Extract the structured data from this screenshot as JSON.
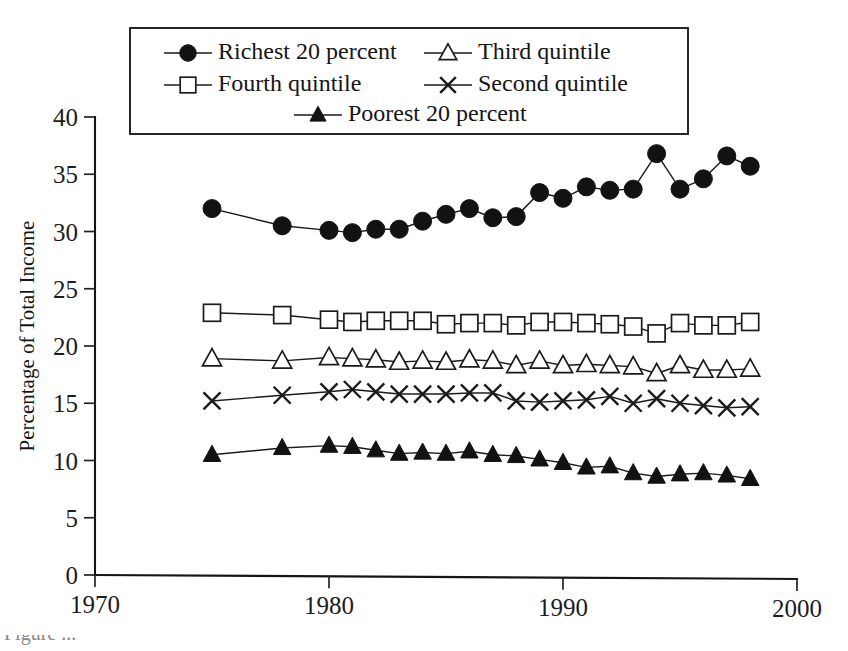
{
  "chart_data": {
    "type": "line",
    "title": "",
    "subtitle": "",
    "xlabel": "",
    "ylabel": "Percentage of Total Income",
    "xlim": [
      1970,
      2000
    ],
    "ylim": [
      0,
      40
    ],
    "xticks": [
      1970,
      1980,
      1990,
      2000
    ],
    "xtick_labels": [
      "1970",
      "1980",
      "1990",
      "2000"
    ],
    "yticks": [
      0,
      5,
      10,
      15,
      20,
      25,
      30,
      35,
      40
    ],
    "ytick_labels": [
      "0",
      "5",
      "10",
      "15",
      "20",
      "25",
      "30",
      "35",
      "40"
    ],
    "grid": false,
    "legend_position": "top-inside",
    "x": [
      1975,
      1978,
      1980,
      1981,
      1982,
      1983,
      1984,
      1985,
      1986,
      1987,
      1988,
      1989,
      1990,
      1991,
      1992,
      1993,
      1994,
      1995,
      1996,
      1997,
      1998
    ],
    "series": [
      {
        "name": "Richest 20 percent",
        "marker": "filled-circle",
        "values": [
          32.0,
          30.5,
          30.1,
          29.9,
          30.2,
          30.2,
          30.9,
          31.5,
          32.0,
          31.2,
          31.3,
          33.4,
          32.9,
          33.9,
          33.6,
          33.7,
          36.8,
          33.7,
          34.6,
          36.6,
          35.7
        ]
      },
      {
        "name": "Fourth quintile",
        "marker": "open-square",
        "values": [
          22.9,
          22.7,
          22.3,
          22.1,
          22.2,
          22.2,
          22.2,
          21.9,
          22.0,
          22.0,
          21.8,
          22.1,
          22.1,
          22.0,
          21.9,
          21.7,
          21.1,
          22.0,
          21.8,
          21.8,
          22.1
        ]
      },
      {
        "name": "Third quintile",
        "marker": "open-triangle",
        "values": [
          18.9,
          18.7,
          19.0,
          18.9,
          18.8,
          18.6,
          18.7,
          18.6,
          18.8,
          18.7,
          18.3,
          18.7,
          18.3,
          18.4,
          18.3,
          18.2,
          17.6,
          18.3,
          17.9,
          17.9,
          18.0
        ]
      },
      {
        "name": "Second quintile",
        "marker": "cross",
        "values": [
          15.2,
          15.7,
          16.0,
          16.2,
          16.0,
          15.8,
          15.8,
          15.8,
          15.9,
          15.9,
          15.2,
          15.1,
          15.2,
          15.3,
          15.6,
          15.0,
          15.4,
          15.0,
          14.8,
          14.6,
          14.7
        ]
      },
      {
        "name": "Poorest 20 percent",
        "marker": "filled-triangle",
        "values": [
          10.5,
          11.1,
          11.3,
          11.2,
          10.9,
          10.6,
          10.7,
          10.6,
          10.8,
          10.5,
          10.4,
          10.1,
          9.8,
          9.4,
          9.5,
          8.9,
          8.6,
          8.8,
          8.9,
          8.7,
          8.4
        ]
      }
    ],
    "legend": [
      {
        "label": "Richest 20 percent",
        "marker": "filled-circle"
      },
      {
        "label": "Third quintile",
        "marker": "open-triangle"
      },
      {
        "label": "Fourth quintile",
        "marker": "open-square"
      },
      {
        "label": "Second quintile",
        "marker": "cross"
      },
      {
        "label": "Poorest 20 percent",
        "marker": "filled-triangle"
      }
    ],
    "axis_colors": {
      "line": "#151515",
      "text": "#1c1c1c"
    }
  },
  "caption": {
    "text": "Figure ..."
  }
}
